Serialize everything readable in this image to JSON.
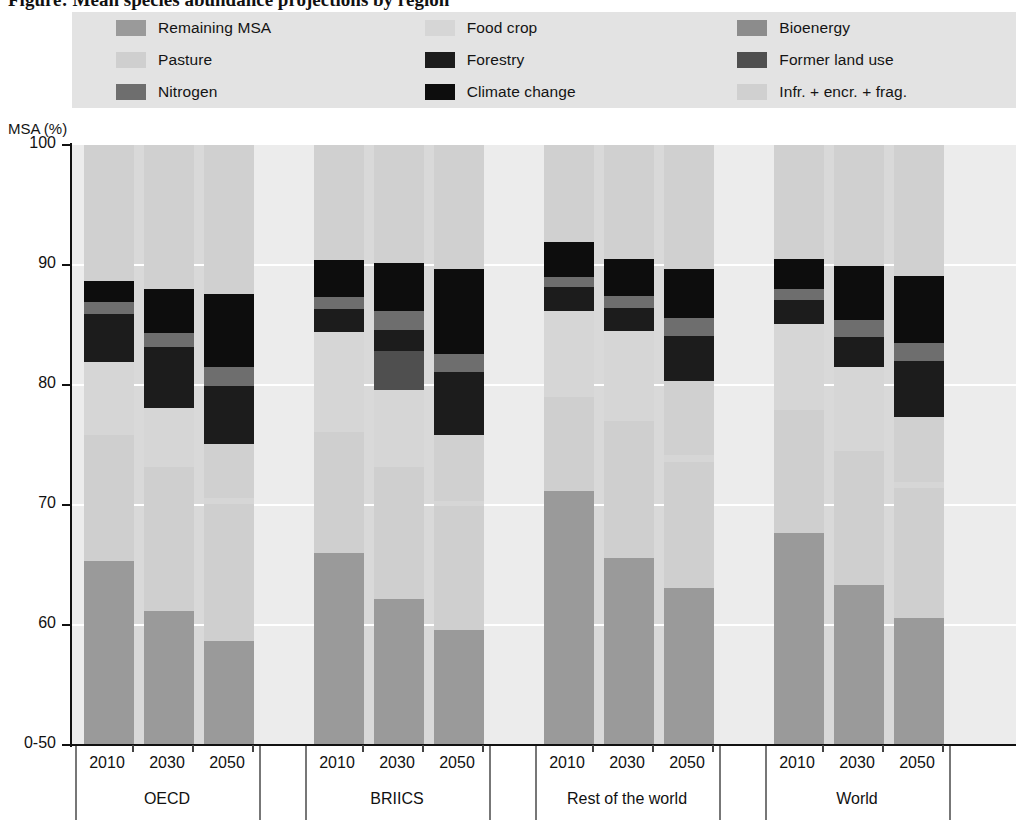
{
  "figure": {
    "title": "Figure: Mean species abundance projections by region"
  },
  "axis": {
    "y_title": "MSA (%)",
    "y_ticks": [
      "100",
      "90",
      "80",
      "70",
      "60",
      "0-50"
    ],
    "y_tick_values": [
      100,
      90,
      80,
      70,
      60,
      50
    ],
    "ylim": [
      50,
      100
    ]
  },
  "legend": {
    "items": [
      {
        "label": "Remaining MSA",
        "color": "#9a9a9a",
        "col": 1
      },
      {
        "label": "Pasture",
        "color": "#cfcfcf",
        "col": 1
      },
      {
        "label": "Nitrogen",
        "color": "#6e6e6e",
        "col": 1
      },
      {
        "label": "Food crop",
        "color": "#d6d6d6",
        "col": 2
      },
      {
        "label": "Forestry",
        "color": "#1c1c1c",
        "col": 2
      },
      {
        "label": "Climate change",
        "color": "#0d0d0d",
        "col": 2
      },
      {
        "label": "Bioenergy",
        "color": "#8c8c8c",
        "col": 3
      },
      {
        "label": "Former land use",
        "color": "#4f4f4f",
        "col": 3
      },
      {
        "label": "Infr. + encr. + frag.",
        "color": "#d0d0d0",
        "col": 3
      }
    ]
  },
  "chart_data": {
    "type": "bar",
    "subtype": "stacked-bar",
    "title": "Figure: Mean species abundance projections by region",
    "xlabel": "",
    "ylabel": "MSA (%)",
    "ylim": [
      50,
      100
    ],
    "grid": true,
    "legend_position": "top",
    "stack_order_bottom_to_top": [
      "Remaining MSA",
      "Pasture",
      "Food crop",
      "Bioenergy",
      "Infr. + encr. + frag.",
      "Former land use",
      "Forestry",
      "Nitrogen",
      "Climate change"
    ],
    "series_colors": {
      "Remaining MSA": "#9a9a9a",
      "Pasture": "#cfcfcf",
      "Food crop": "#d6d6d6",
      "Bioenergy": "#8c8c8c",
      "Infr. + encr. + frag.": "#d0d0d0",
      "Former land use": "#4f4f4f",
      "Forestry": "#1c1c1c",
      "Nitrogen": "#6e6e6e",
      "Climate change": "#0d0d0d"
    },
    "groups": [
      {
        "name": "OECD",
        "years": [
          "2010",
          "2030",
          "2050"
        ],
        "bars": [
          {
            "year": "2010",
            "remaining_msa_top": 65.3,
            "pasture_top": 75.8,
            "food_crop_top": 81.9,
            "bioenergy_top": 81.9,
            "infr_top": 81.9,
            "former_land_use_top": 81.9,
            "forestry_top": 85.9,
            "nitrogen_top": 86.9,
            "climate_change_top": 88.7
          },
          {
            "year": "2030",
            "remaining_msa_top": 61.2,
            "pasture_top": 73.2,
            "food_crop_top": 78.1,
            "bioenergy_top": 78.1,
            "infr_top": 78.1,
            "former_land_use_top": 78.1,
            "forestry_top": 83.2,
            "nitrogen_top": 84.3,
            "climate_change_top": 88.0
          },
          {
            "year": "2050",
            "remaining_msa_top": 58.7,
            "pasture_top": 70.1,
            "food_crop_top": 70.6,
            "bioenergy_top": 70.6,
            "infr_top": 75.1,
            "former_land_use_top": 75.1,
            "forestry_top": 79.9,
            "nitrogen_top": 81.5,
            "climate_change_top": 87.6
          }
        ]
      },
      {
        "name": "BRIICS",
        "years": [
          "2010",
          "2030",
          "2050"
        ],
        "bars": [
          {
            "year": "2010",
            "remaining_msa_top": 66.0,
            "pasture_top": 76.1,
            "food_crop_top": 84.4,
            "bioenergy_top": 84.4,
            "infr_top": 84.4,
            "former_land_use_top": 84.4,
            "forestry_top": 86.3,
            "nitrogen_top": 87.3,
            "climate_change_top": 90.4
          },
          {
            "year": "2030",
            "remaining_msa_top": 62.2,
            "pasture_top": 73.2,
            "food_crop_top": 79.6,
            "bioenergy_top": 79.6,
            "infr_top": 79.6,
            "former_land_use_top": 82.8,
            "forestry_top": 84.6,
            "nitrogen_top": 86.2,
            "climate_change_top": 90.2
          },
          {
            "year": "2050",
            "remaining_msa_top": 59.6,
            "pasture_top": 69.9,
            "food_crop_top": 70.3,
            "bioenergy_top": 70.3,
            "infr_top": 75.8,
            "former_land_use_top": 75.8,
            "forestry_top": 81.1,
            "nitrogen_top": 82.6,
            "climate_change_top": 89.7
          }
        ]
      },
      {
        "name": "Rest of the world",
        "years": [
          "2010",
          "2030",
          "2050"
        ],
        "bars": [
          {
            "year": "2010",
            "remaining_msa_top": 71.2,
            "pasture_top": 79.0,
            "food_crop_top": 86.2,
            "bioenergy_top": 86.2,
            "infr_top": 86.2,
            "former_land_use_top": 86.2,
            "forestry_top": 88.2,
            "nitrogen_top": 89.0,
            "climate_change_top": 91.9
          },
          {
            "year": "2030",
            "remaining_msa_top": 65.6,
            "pasture_top": 77.0,
            "food_crop_top": 84.5,
            "bioenergy_top": 84.5,
            "infr_top": 84.5,
            "former_land_use_top": 84.5,
            "forestry_top": 86.4,
            "nitrogen_top": 87.4,
            "climate_change_top": 90.5
          },
          {
            "year": "2050",
            "remaining_msa_top": 63.1,
            "pasture_top": 73.6,
            "food_crop_top": 74.2,
            "bioenergy_top": 74.2,
            "infr_top": 80.3,
            "former_land_use_top": 80.3,
            "forestry_top": 84.1,
            "nitrogen_top": 85.6,
            "climate_change_top": 89.7
          }
        ]
      },
      {
        "name": "World",
        "years": [
          "2010",
          "2030",
          "2050"
        ],
        "bars": [
          {
            "year": "2010",
            "remaining_msa_top": 67.7,
            "pasture_top": 77.9,
            "food_crop_top": 85.1,
            "bioenergy_top": 85.1,
            "infr_top": 85.1,
            "former_land_use_top": 85.1,
            "forestry_top": 87.1,
            "nitrogen_top": 88.0,
            "climate_change_top": 90.5
          },
          {
            "year": "2030",
            "remaining_msa_top": 63.3,
            "pasture_top": 74.5,
            "food_crop_top": 81.5,
            "bioenergy_top": 81.5,
            "infr_top": 81.5,
            "former_land_use_top": 81.5,
            "forestry_top": 84.0,
            "nitrogen_top": 85.4,
            "climate_change_top": 89.9
          },
          {
            "year": "2050",
            "remaining_msa_top": 60.6,
            "pasture_top": 71.4,
            "food_crop_top": 71.9,
            "bioenergy_top": 71.9,
            "infr_top": 77.3,
            "former_land_use_top": 77.3,
            "forestry_top": 82.0,
            "nitrogen_top": 83.5,
            "climate_change_top": 89.1
          }
        ]
      }
    ]
  }
}
